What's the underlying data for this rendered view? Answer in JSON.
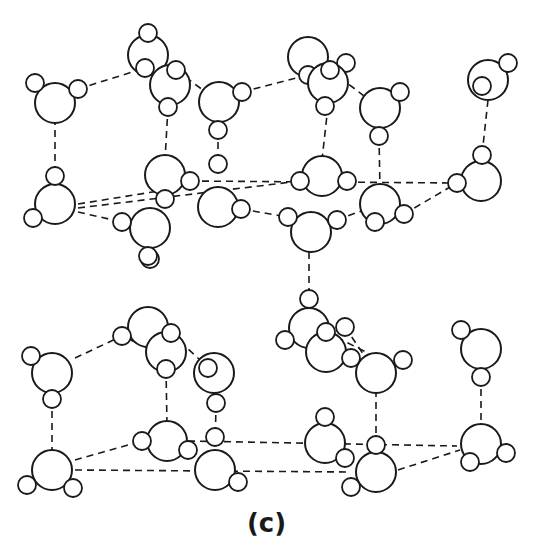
{
  "figure": {
    "caption": "(c)",
    "colors": {
      "stroke": "#1a1a1a",
      "background": "#ffffff"
    },
    "legend_semantics": {
      "large_circle": "oxygen atom",
      "small_circle": "hydrogen atom",
      "dashed_line": "hydrogen bond"
    }
  },
  "molecules": [
    {
      "o": [
        55,
        103
      ],
      "h": [
        [
          35,
          83
        ],
        [
          78,
          89
        ]
      ]
    },
    {
      "o": [
        148,
        55
      ],
      "h": [
        [
          148,
          33
        ],
        [
          145,
          68
        ]
      ]
    },
    {
      "o": [
        170,
        85
      ],
      "h": [
        [
          168,
          107
        ],
        [
          176,
          70
        ]
      ]
    },
    {
      "o": [
        219,
        102
      ],
      "h": [
        [
          218,
          130
        ],
        [
          242,
          92
        ]
      ]
    },
    {
      "o": [
        308,
        57
      ],
      "h": [
        [
          308,
          75
        ],
        [
          346,
          63
        ]
      ]
    },
    {
      "o": [
        328,
        83
      ],
      "h": [
        [
          325,
          106
        ],
        [
          330,
          70
        ]
      ]
    },
    {
      "o": [
        380,
        108
      ],
      "h": [
        [
          379,
          136
        ],
        [
          400,
          92
        ]
      ]
    },
    {
      "o": [
        488,
        80
      ],
      "h": [
        [
          482,
          86
        ],
        [
          508,
          63
        ]
      ]
    },
    {
      "o": [
        55,
        204
      ],
      "h": [
        [
          55,
          176
        ],
        [
          33,
          218
        ]
      ]
    },
    {
      "o": [
        165,
        175
      ],
      "h": [
        [
          190,
          181
        ],
        [
          165,
          199
        ]
      ]
    },
    {
      "o": [
        218,
        207
      ],
      "h": [
        [
          218,
          164
        ],
        [
          241,
          209
        ]
      ]
    },
    {
      "o": [
        150,
        228
      ],
      "h": [
        [
          122,
          222
        ],
        [
          150,
          259
        ]
      ]
    },
    {
      "o": [
        322,
        176
      ],
      "h": [
        [
          300,
          181
        ],
        [
          347,
          181
        ]
      ]
    },
    {
      "o": [
        380,
        204
      ],
      "h": [
        [
          375,
          222
        ],
        [
          404,
          214
        ]
      ]
    },
    {
      "o": [
        311,
        232
      ],
      "h": [
        [
          288,
          217
        ],
        [
          337,
          220
        ]
      ]
    },
    {
      "o": [
        481,
        181
      ],
      "h": [
        [
          482,
          155
        ],
        [
          457,
          183
        ]
      ]
    },
    {
      "o": [
        148,
        327
      ],
      "h": [
        [
          148,
          256
        ],
        [
          122,
          336
        ]
      ]
    },
    {
      "o": [
        166,
        352
      ],
      "h": [
        [
          166,
          369
        ],
        [
          171,
          333
        ]
      ]
    },
    {
      "o": [
        52,
        373
      ],
      "h": [
        [
          31,
          356
        ],
        [
          52,
          399
        ]
      ]
    },
    {
      "o": [
        214,
        373
      ],
      "h": [
        [
          208,
          368
        ],
        [
          216,
          403
        ]
      ]
    },
    {
      "o": [
        309,
        328
      ],
      "h": [
        [
          309,
          299
        ],
        [
          285,
          340
        ]
      ]
    },
    {
      "o": [
        326,
        352
      ],
      "h": [
        [
          345,
          327
        ],
        [
          326,
          332
        ]
      ]
    },
    {
      "o": [
        376,
        373
      ],
      "h": [
        [
          351,
          358
        ],
        [
          403,
          360
        ]
      ]
    },
    {
      "o": [
        481,
        349
      ],
      "h": [
        [
          461,
          330
        ],
        [
          481,
          377
        ]
      ]
    },
    {
      "o": [
        52,
        470
      ],
      "h": [
        [
          27,
          485
        ],
        [
          73,
          488
        ]
      ]
    },
    {
      "o": [
        167,
        441
      ],
      "h": [
        [
          142,
          441
        ],
        [
          188,
          450
        ]
      ]
    },
    {
      "o": [
        215,
        470
      ],
      "h": [
        [
          215,
          437
        ],
        [
          238,
          482
        ]
      ]
    },
    {
      "o": [
        325,
        443
      ],
      "h": [
        [
          325,
          417
        ],
        [
          345,
          458
        ]
      ]
    },
    {
      "o": [
        376,
        472
      ],
      "h": [
        [
          376,
          445
        ],
        [
          351,
          487
        ]
      ]
    },
    {
      "o": [
        481,
        444
      ],
      "h": [
        [
          470,
          462
        ],
        [
          506,
          453
        ]
      ]
    }
  ],
  "bonds": [
    [
      78,
      89,
      145,
      68
    ],
    [
      176,
      70,
      219,
      102
    ],
    [
      242,
      92,
      308,
      75
    ],
    [
      330,
      70,
      380,
      108
    ],
    [
      55,
      118,
      55,
      176
    ],
    [
      168,
      107,
      165,
      160
    ],
    [
      218,
      130,
      218,
      164
    ],
    [
      379,
      136,
      380,
      190
    ],
    [
      328,
      106,
      322,
      160
    ],
    [
      488,
      100,
      482,
      155
    ],
    [
      78,
      204,
      165,
      190
    ],
    [
      78,
      208,
      300,
      181
    ],
    [
      78,
      212,
      122,
      222
    ],
    [
      190,
      181,
      457,
      183
    ],
    [
      241,
      209,
      288,
      217
    ],
    [
      337,
      220,
      380,
      204
    ],
    [
      404,
      214,
      457,
      183
    ],
    [
      150,
      249,
      148,
      256
    ],
    [
      309,
      252,
      309,
      299
    ],
    [
      148,
      348,
      122,
      336
    ],
    [
      75,
      358,
      122,
      336
    ],
    [
      171,
      333,
      214,
      373
    ],
    [
      345,
      327,
      376,
      373
    ],
    [
      326,
      332,
      366,
      352
    ],
    [
      52,
      399,
      52,
      455
    ],
    [
      166,
      369,
      167,
      425
    ],
    [
      216,
      403,
      215,
      455
    ],
    [
      376,
      390,
      376,
      445
    ],
    [
      481,
      377,
      481,
      428
    ],
    [
      75,
      460,
      142,
      441
    ],
    [
      75,
      470,
      351,
      472
    ],
    [
      188,
      441,
      457,
      446
    ],
    [
      398,
      470,
      460,
      450
    ],
    [
      326,
      443,
      325,
      458
    ]
  ]
}
